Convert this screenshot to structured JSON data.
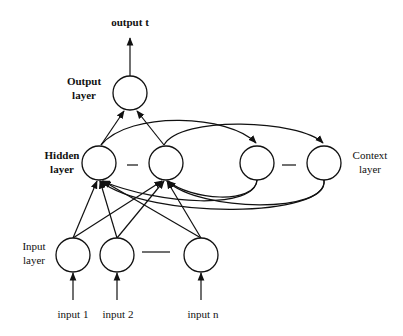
{
  "diagram": {
    "labels": {
      "output": "output t",
      "output_layer_1": "Output",
      "output_layer_2": "layer",
      "hidden_layer_1": "Hidden",
      "hidden_layer_2": "layer",
      "context_layer_1": "Context",
      "context_layer_2": "layer",
      "input_layer_1": "Input",
      "input_layer_2": "layer",
      "input_1": "input 1",
      "input_2": "input 2",
      "input_n": "input  n"
    },
    "colors": {
      "stroke": "#111111",
      "background": "#ffffff"
    }
  }
}
